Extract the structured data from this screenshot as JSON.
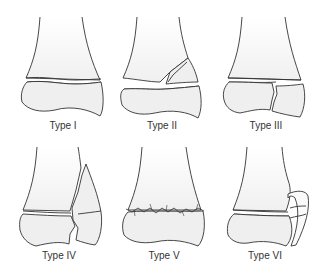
{
  "figure": {
    "panels": [
      {
        "id": "type-1",
        "label": "Type I"
      },
      {
        "id": "type-2",
        "label": "Type II"
      },
      {
        "id": "type-3",
        "label": "Type III"
      },
      {
        "id": "type-4",
        "label": "Type IV"
      },
      {
        "id": "type-5",
        "label": "Type V"
      },
      {
        "id": "type-6",
        "label": "Type VI"
      }
    ],
    "colors": {
      "line": "#333333",
      "epiphysis_fill": "#f2f2f2",
      "shaft_fill": "#ffffff"
    }
  }
}
